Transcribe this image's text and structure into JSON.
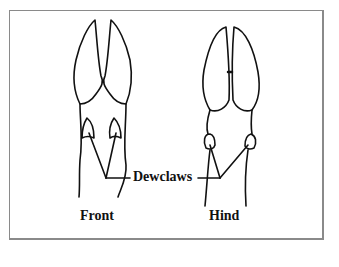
{
  "diagram": {
    "labels": {
      "dewclaws": "Dewclaws",
      "front": "Front",
      "hind": "Hind"
    },
    "colors": {
      "line": "#111111",
      "frame": "#8a8a8a",
      "background": "#ffffff"
    },
    "parts": [
      "front-hoof",
      "hind-hoof",
      "dewclaws"
    ]
  }
}
